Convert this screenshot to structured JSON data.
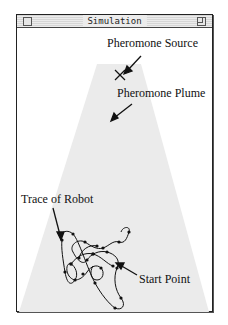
{
  "window": {
    "title": "Simulation",
    "close_icon": "close-box",
    "zoom_icon": "zoom-box"
  },
  "labels": {
    "source": "Pheromone Source",
    "plume": "Pheromone Plume",
    "trace": "Trace of Robot",
    "start": "Start Point"
  },
  "colors": {
    "plume_fill": "#ebebeb",
    "trace": "#111111",
    "window_border": "#222222"
  },
  "markers": {
    "source_marker": "x-mark"
  }
}
